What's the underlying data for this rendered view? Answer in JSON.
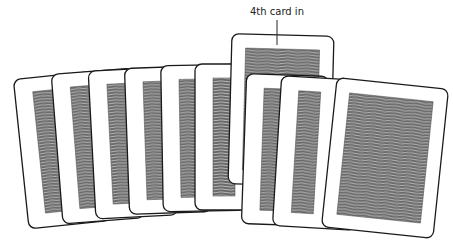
{
  "diagram": {
    "title": "",
    "annotation": {
      "label": "4th card in",
      "x": 277,
      "y": 15
    },
    "colors": {
      "card_face": "#ffffff",
      "card_border": "#1a1a1a",
      "pattern_fill": "#6a6a6a",
      "pattern_line": "#d8d8d8"
    },
    "cards": [
      {
        "id": 1,
        "cx": 62,
        "cy": 150,
        "w": 82,
        "h": 150,
        "rot": -6,
        "style": "left-stack"
      },
      {
        "id": 2,
        "cx": 98,
        "cy": 146,
        "w": 82,
        "h": 150,
        "rot": -4.5,
        "style": "left-stack"
      },
      {
        "id": 3,
        "cx": 133,
        "cy": 143,
        "w": 82,
        "h": 148,
        "rot": -3,
        "style": "left-stack"
      },
      {
        "id": 4,
        "cx": 168,
        "cy": 140,
        "w": 82,
        "h": 146,
        "rot": -2,
        "style": "left-stack"
      },
      {
        "id": 5,
        "cx": 203,
        "cy": 138,
        "w": 82,
        "h": 146,
        "rot": -1,
        "style": "left-stack"
      },
      {
        "id": 6,
        "cx": 236,
        "cy": 137,
        "w": 82,
        "h": 146,
        "rot": 0,
        "style": "left-stack"
      },
      {
        "id": 7,
        "cx": 281,
        "cy": 110,
        "w": 102,
        "h": 150,
        "rot": 1.5,
        "style": "raised"
      },
      {
        "id": 8,
        "cx": 285,
        "cy": 150,
        "w": 82,
        "h": 150,
        "rot": 2,
        "style": "right-stack"
      },
      {
        "id": 9,
        "cx": 318,
        "cy": 153,
        "w": 82,
        "h": 150,
        "rot": 3.5,
        "style": "right-stack"
      },
      {
        "id": 10,
        "cx": 385,
        "cy": 158,
        "w": 112,
        "h": 150,
        "rot": 6,
        "style": "right-front"
      }
    ]
  }
}
